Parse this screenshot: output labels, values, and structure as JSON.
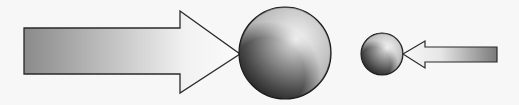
{
  "diagram": {
    "elements": [
      {
        "id": "large-arrow",
        "direction": "right",
        "shape": "block-arrow"
      },
      {
        "id": "large-sphere",
        "size": "large"
      },
      {
        "id": "small-sphere",
        "size": "small"
      },
      {
        "id": "small-arrow",
        "direction": "left",
        "shape": "block-arrow"
      }
    ],
    "colors": {
      "background": "#f7f7f7",
      "outline": "#2a2a2a",
      "arrow_dark": "#8a8a8a",
      "arrow_light": "#f4f4f4",
      "sphere_highlight": "#e8e8e8",
      "sphere_dark": "#1e1e1e"
    }
  }
}
